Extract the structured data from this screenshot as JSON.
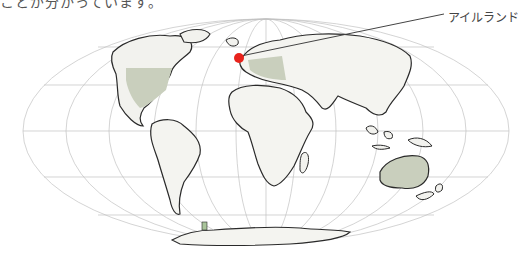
{
  "caption": {
    "text": "ことが分かっています。"
  },
  "map": {
    "projection": "mollweide",
    "marker": {
      "label": "アイルランド",
      "color": "#e8231c"
    },
    "colors": {
      "grid": "#b8b8b8",
      "land_outline": "#2a2a2a",
      "land_fill": "#f4f4f0",
      "highlight_fill": "#c9cfbd",
      "leader_line": "#444444"
    }
  }
}
